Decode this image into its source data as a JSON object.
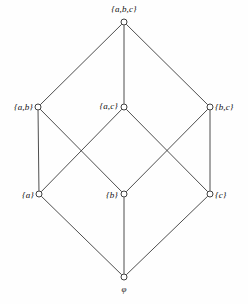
{
  "figure": {
    "kind": "hasse-diagram",
    "background_color": "#fefefe",
    "line_color": "#3a3a3a",
    "node_fill_color": "#ffffff",
    "node_stroke_color": "#2b2b2b",
    "label_color": "#111111"
  },
  "nodes": [
    {
      "id": "abc",
      "label": "{a,b,c}",
      "x": 124,
      "y": 22,
      "label_pos": "above",
      "label_x": 124,
      "label_y": 14
    },
    {
      "id": "ab",
      "label": "{a,b}",
      "x": 38,
      "y": 107,
      "label_pos": "left",
      "label_x": 33,
      "label_y": 107
    },
    {
      "id": "ac",
      "label": "{a,c}",
      "x": 124,
      "y": 107,
      "label_pos": "left",
      "label_x": 118,
      "label_y": 106
    },
    {
      "id": "bc",
      "label": "{b,c}",
      "x": 210,
      "y": 107,
      "label_pos": "right",
      "label_x": 215,
      "label_y": 107
    },
    {
      "id": "a",
      "label": "{a}",
      "x": 39,
      "y": 194,
      "label_pos": "left",
      "label_x": 34,
      "label_y": 195
    },
    {
      "id": "b",
      "label": "{b}",
      "x": 124,
      "y": 194,
      "label_pos": "left",
      "label_x": 118,
      "label_y": 195
    },
    {
      "id": "c",
      "label": "{c}",
      "x": 210,
      "y": 194,
      "label_pos": "right",
      "label_x": 215,
      "label_y": 195
    },
    {
      "id": "empty",
      "label": "φ",
      "x": 124,
      "y": 277,
      "label_pos": "below",
      "label_x": 124,
      "label_y": 285
    }
  ],
  "edges": [
    {
      "from": "abc",
      "to": "ab"
    },
    {
      "from": "abc",
      "to": "ac"
    },
    {
      "from": "abc",
      "to": "bc"
    },
    {
      "from": "ab",
      "to": "a"
    },
    {
      "from": "ab",
      "to": "b"
    },
    {
      "from": "ac",
      "to": "a"
    },
    {
      "from": "ac",
      "to": "c"
    },
    {
      "from": "bc",
      "to": "b"
    },
    {
      "from": "bc",
      "to": "c"
    },
    {
      "from": "a",
      "to": "empty"
    },
    {
      "from": "b",
      "to": "empty"
    },
    {
      "from": "c",
      "to": "empty"
    }
  ]
}
